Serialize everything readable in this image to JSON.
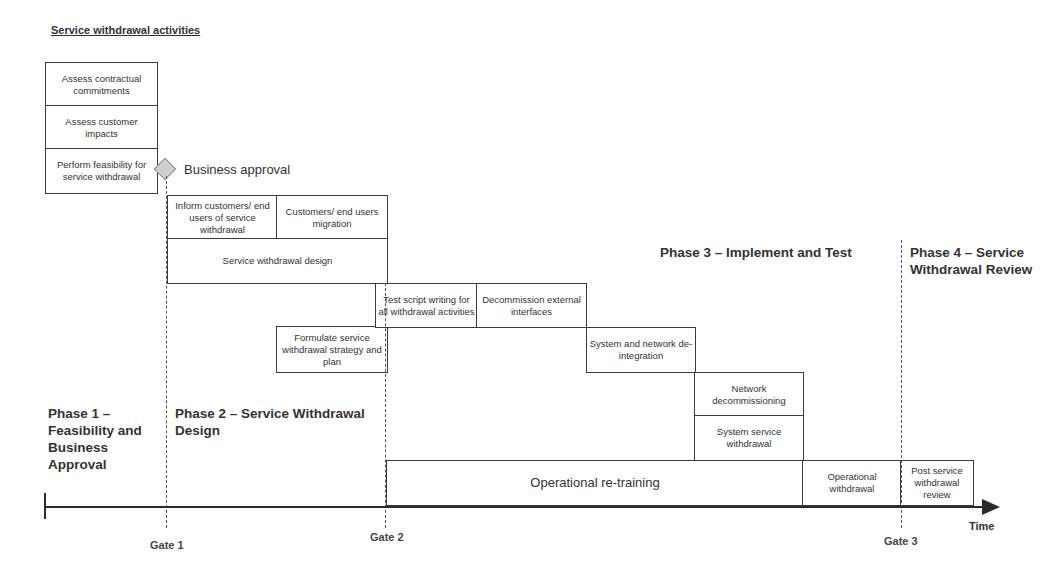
{
  "title": "Service withdrawal activities",
  "milestone": {
    "icon": "diamond-icon",
    "label": "Business approval"
  },
  "phases": {
    "p1": "Phase 1 – Feasibility and Business Approval",
    "p2": "Phase 2 – Service Withdrawal Design",
    "p3": "Phase 3 – Implement and Test",
    "p4": "Phase 4 – Service Withdrawal Review"
  },
  "gates": {
    "g1": "Gate 1",
    "g2": "Gate 2",
    "g3": "Gate 3"
  },
  "axis": {
    "label": "Time"
  },
  "activities": {
    "assess_contractual": "Assess contractual commitments",
    "assess_customer": "Assess customer impacts",
    "feasibility": "Perform feasibility for service withdrawal",
    "inform_customers": "Inform customers/ end users of service withdrawal",
    "customer_migration": "Customers/ end users migration",
    "design": "Service withdrawal design",
    "strategy": "Formulate service withdrawal strategy and plan",
    "test_script": "Test script writing for all withdrawal activities",
    "decommission_ext": "Decommission external interfaces",
    "deintegration": "System and network de-integration",
    "network_decom": "Network decommissioning",
    "system_withdrawal": "System service withdrawal",
    "retraining": "Operational re-training",
    "op_withdrawal": "Operational withdrawal",
    "post_review": "Post service withdrawal review"
  }
}
